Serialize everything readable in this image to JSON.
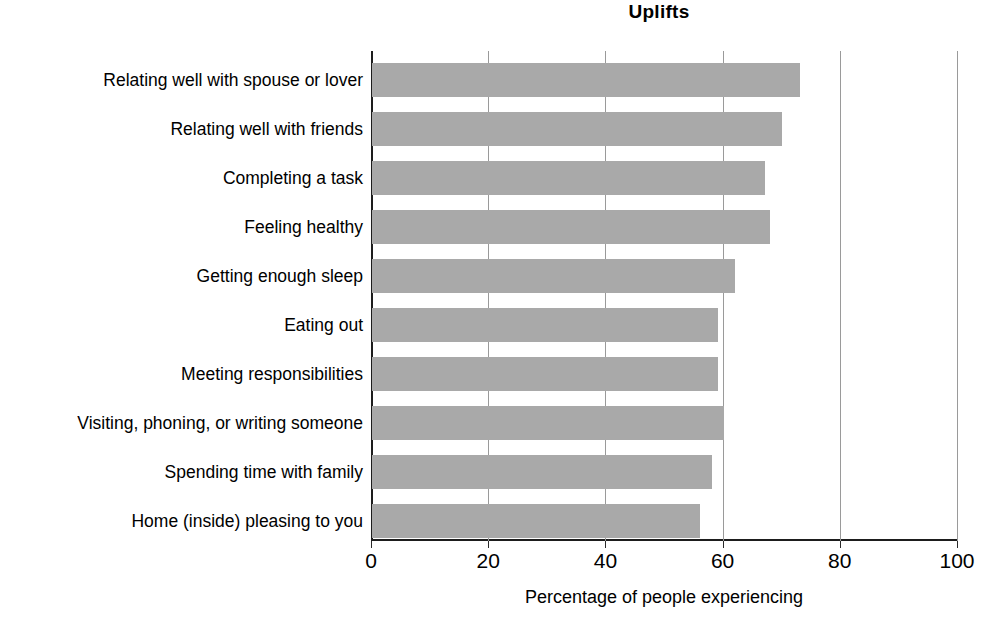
{
  "chart_data": {
    "type": "bar",
    "orientation": "horizontal",
    "title": "Uplifts",
    "xlabel": "Percentage of people experiencing",
    "ylabel": "",
    "xlim": [
      0,
      100
    ],
    "ylim": null,
    "grid": true,
    "legend": null,
    "xticks": [
      "0",
      "20",
      "40",
      "60",
      "80",
      "100"
    ],
    "xtick_values": [
      0,
      20,
      40,
      60,
      80,
      100
    ],
    "categories": [
      "Relating well with spouse or lover",
      "Relating well with friends",
      "Completing a task",
      "Feeling healthy",
      "Getting enough sleep",
      "Eating out",
      "Meeting responsibilities",
      "Visiting, phoning, or writing someone",
      "Spending time with family",
      "Home (inside) pleasing to you"
    ],
    "values": [
      73,
      70,
      67,
      68,
      62,
      59,
      59,
      60,
      58,
      56
    ],
    "bar_color": "#a9a9a9",
    "axis_color": "#1d1d1d",
    "gridline_color": "#9a9a9a",
    "text_color": "#000000"
  }
}
